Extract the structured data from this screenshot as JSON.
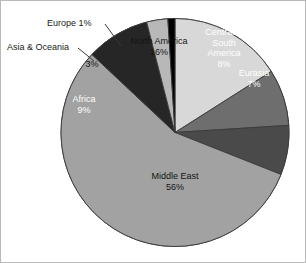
{
  "chart_data": {
    "type": "pie",
    "title": "",
    "subtitle": "",
    "xlabel": "",
    "ylabel": "",
    "legend_position": "none",
    "grid": false,
    "total": 100,
    "units": "percent",
    "start_angle_deg": 0,
    "direction": "clockwise",
    "categories": [
      "North America",
      "Central & South America",
      "Eurasia",
      "Middle East",
      "Africa",
      "Asia & Oceania",
      "Europe"
    ],
    "values": [
      16,
      8,
      7,
      56,
      9,
      3,
      1
    ],
    "value_labels": [
      "16%",
      "8%",
      "7%",
      "56%",
      "9%",
      "3%",
      "1%"
    ],
    "colors": [
      "#d8d8d8",
      "#6e6e6e",
      "#4a4a4a",
      "#a2a2a2",
      "#262626",
      "#b8b8b8",
      "#000000"
    ],
    "slices": [
      {
        "name": "North America",
        "value": 16,
        "value_label": "16%",
        "color": "#d8d8d8",
        "label_placement": "inside",
        "label_text_color": "dark"
      },
      {
        "name": "Central & South America",
        "value": 8,
        "value_label": "8%",
        "color": "#6e6e6e",
        "label_placement": "inside",
        "label_text_color": "light"
      },
      {
        "name": "Eurasia",
        "value": 7,
        "value_label": "7%",
        "color": "#4a4a4a",
        "label_placement": "inside",
        "label_text_color": "light"
      },
      {
        "name": "Middle East",
        "value": 56,
        "value_label": "56%",
        "color": "#a2a2a2",
        "label_placement": "inside",
        "label_text_color": "dark"
      },
      {
        "name": "Africa",
        "value": 9,
        "value_label": "9%",
        "color": "#262626",
        "label_placement": "inside",
        "label_text_color": "light"
      },
      {
        "name": "Asia & Oceania",
        "value": 3,
        "value_label": "3%",
        "color": "#b8b8b8",
        "label_placement": "callout",
        "label_text_color": "dark"
      },
      {
        "name": "Europe",
        "value": 1,
        "value_label": "1%",
        "color": "#000000",
        "label_placement": "callout",
        "label_text_color": "dark"
      }
    ]
  },
  "labels": {
    "north_america_name": "North America",
    "north_america_pct": "16%",
    "central_south_america_line1": "Central &",
    "central_south_america_line2": "South",
    "central_south_america_line3": "America",
    "central_south_america_pct": "8%",
    "eurasia_name": "Eurasia",
    "eurasia_pct": "7%",
    "middle_east_name": "Middle East",
    "middle_east_pct": "56%",
    "africa_name": "Africa",
    "africa_pct": "9%",
    "asia_oceania_name": "Asia & Oceania",
    "asia_oceania_pct": "3%",
    "europe_callout": "Europe 1%"
  },
  "style": {
    "background": "#ffffff",
    "frame_border": "#b9b9b9",
    "slice_outline": "#3a3a3a",
    "leader_line": "#3a3a3a",
    "text_dark": "#1a1a1a",
    "text_light": "#ffffff"
  }
}
